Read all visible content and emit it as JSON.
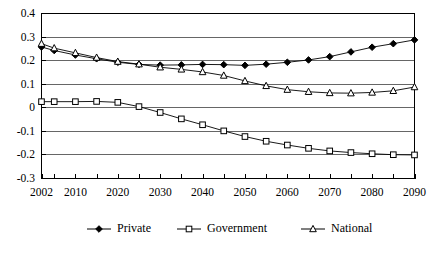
{
  "chart_data": {
    "type": "line",
    "title": "",
    "subtitle": "",
    "xlabel": "",
    "ylabel": "",
    "x": [
      2002,
      2005,
      2010,
      2015,
      2020,
      2025,
      2030,
      2035,
      2040,
      2045,
      2050,
      2055,
      2060,
      2065,
      2070,
      2075,
      2080,
      2085,
      2090
    ],
    "xlim": [
      2002,
      2090
    ],
    "ylim": [
      -0.3,
      0.4
    ],
    "grid": true,
    "grid_axis": "y",
    "legend_position": "bottom",
    "xtick_labels": [
      "2002",
      "2010",
      "2020",
      "2030",
      "2040",
      "2050",
      "2060",
      "2070",
      "2080",
      "2090"
    ],
    "xtick_values": [
      2002,
      2010,
      2020,
      2030,
      2040,
      2050,
      2060,
      2070,
      2080,
      2090
    ],
    "ytick_labels": [
      "0.4",
      "0.3",
      "0.2",
      "0.1",
      "0",
      "-0.1",
      "-0.2",
      "-0.3"
    ],
    "ytick_values": [
      0.4,
      0.3,
      0.2,
      0.1,
      0,
      -0.1,
      -0.2,
      -0.3
    ],
    "series": [
      {
        "name": "Private",
        "marker": "diamond",
        "marker_fill": "#000000",
        "color": "#000000",
        "values": [
          0.258,
          0.243,
          0.224,
          0.208,
          0.193,
          0.184,
          0.181,
          0.182,
          0.184,
          0.183,
          0.18,
          0.185,
          0.193,
          0.203,
          0.217,
          0.237,
          0.257,
          0.272,
          0.288
        ]
      },
      {
        "name": "Government",
        "marker": "square",
        "marker_fill": "#ffffff",
        "color": "#000000",
        "values": [
          0.026,
          0.026,
          0.026,
          0.027,
          0.023,
          0.005,
          -0.02,
          -0.047,
          -0.072,
          -0.098,
          -0.122,
          -0.142,
          -0.158,
          -0.172,
          -0.183,
          -0.19,
          -0.195,
          -0.199,
          -0.2
        ]
      },
      {
        "name": "National",
        "marker": "triangle",
        "marker_fill": "#ffffff",
        "color": "#000000",
        "values": [
          0.272,
          0.253,
          0.233,
          0.213,
          0.196,
          0.185,
          0.172,
          0.163,
          0.152,
          0.137,
          0.114,
          0.093,
          0.077,
          0.068,
          0.063,
          0.062,
          0.065,
          0.072,
          0.088
        ]
      }
    ]
  },
  "legend": {
    "items": [
      {
        "label": "Private",
        "marker": "diamond"
      },
      {
        "label": "Government",
        "marker": "square"
      },
      {
        "label": "National",
        "marker": "triangle"
      }
    ]
  }
}
